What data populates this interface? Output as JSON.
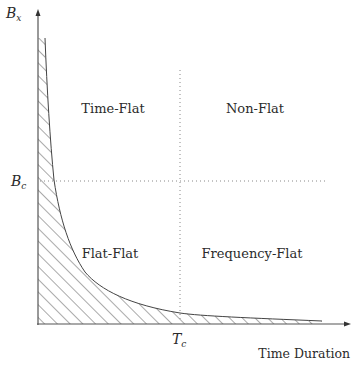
{
  "diagram": {
    "type": "fading-channel-classification",
    "axes": {
      "y_axis": {
        "symbol": "B",
        "subscript": "x"
      },
      "x_axis": {
        "label": "Time Duration"
      }
    },
    "thresholds": {
      "bandwidth": {
        "symbol": "B",
        "subscript": "c"
      },
      "time": {
        "symbol": "T",
        "subscript": "c"
      }
    },
    "regions": [
      {
        "id": "time-flat",
        "label": "Time-Flat",
        "quadrant": "upper-left"
      },
      {
        "id": "non-flat",
        "label": "Non-Flat",
        "quadrant": "upper-right"
      },
      {
        "id": "flat-flat",
        "label": "Flat-Flat",
        "quadrant": "lower-left"
      },
      {
        "id": "frequency-flat",
        "label": "Frequency-Flat",
        "quadrant": "lower-right"
      }
    ],
    "excluded_region": {
      "style": "hatched",
      "boundary": "hyperbola (B·T = const)"
    },
    "colors": {
      "line": "#555555",
      "text": "#2b2b2b",
      "dotted": "#888888"
    }
  }
}
